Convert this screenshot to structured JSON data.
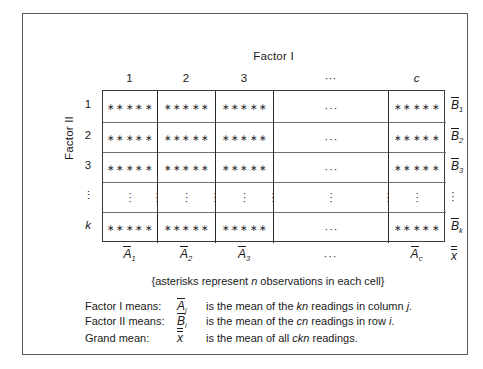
{
  "figure": {
    "factor_i_title": "Factor I",
    "factor_ii_title": "Factor II",
    "asterisk_note_prefix": "{asterisks represent ",
    "asterisk_note_italic": "n",
    "asterisk_note_suffix": " observations in each cell}"
  },
  "table": {
    "column_headers": [
      "1",
      "2",
      "3",
      "···",
      "c"
    ],
    "row_headers": [
      "1",
      "2",
      "3",
      "⋮",
      "k"
    ],
    "cell_stars": "∗∗∗∗∗",
    "cell_hdots": "···",
    "rows": [
      {
        "header": "1",
        "cells": [
          "*****",
          "*****",
          "*****",
          "...",
          "*****"
        ],
        "b_mean_sub": "1"
      },
      {
        "header": "2",
        "cells": [
          "*****",
          "*****",
          "*****",
          "...",
          "*****"
        ],
        "b_mean_sub": "2"
      },
      {
        "header": "3",
        "cells": [
          "*****",
          "*****",
          "*****",
          "...",
          "*****"
        ],
        "b_mean_sub": "3"
      },
      {
        "header": "⋮",
        "cells": [
          "⋮",
          "⋮",
          "⋮",
          "⋮",
          "⋮"
        ],
        "b_mean_sub": ""
      },
      {
        "header": "k",
        "cells": [
          "*****",
          "*****",
          "*****",
          "...",
          "*****"
        ],
        "b_mean_sub": "k"
      }
    ],
    "b_mean_letter": "B",
    "b_mean_subs": [
      "1",
      "2",
      "3",
      "",
      "k"
    ],
    "a_mean_letter": "A",
    "a_mean_subs": [
      "1",
      "2",
      "3",
      "",
      "c"
    ],
    "a_mean_dots": "···",
    "grand_mean_letter": "x"
  },
  "legend": [
    {
      "label": "Factor I means:",
      "symbol_letter": "A",
      "symbol_sub": "j",
      "text_a": " is the mean of the ",
      "text_italic1": "kn",
      "text_b": " readings in column ",
      "text_italic2": "j",
      "text_c": "."
    },
    {
      "label": "Factor II means:",
      "symbol_letter": "B",
      "symbol_sub": "i",
      "text_a": " is the mean of the ",
      "text_italic1": "cn",
      "text_b": " readings in row ",
      "text_italic2": "i",
      "text_c": "."
    },
    {
      "label": "Grand mean:",
      "symbol_letter": "x",
      "symbol_sub": "",
      "text_a": " is the mean of all ",
      "text_italic1": "ckn",
      "text_b": " readings",
      "text_italic2": "",
      "text_c": "."
    }
  ],
  "colors": {
    "frame": "#5a5a5a",
    "table_border": "#3a3a3a",
    "rule_vertical": "#2b2b2b",
    "rule_horizontal": "#6e6e6e",
    "text": "#1a1a1a",
    "background": "#ffffff"
  }
}
